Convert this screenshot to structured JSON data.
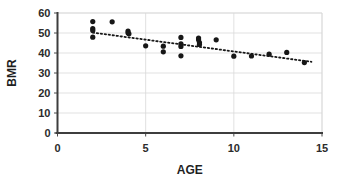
{
  "chart_data": {
    "type": "scatter",
    "title": "",
    "xlabel": "AGE",
    "ylabel": "BMR",
    "xlim": [
      0,
      15
    ],
    "ylim": [
      0,
      60
    ],
    "xticks": [
      0,
      5,
      10,
      15
    ],
    "yticks": [
      0,
      10,
      20,
      30,
      40,
      50,
      60
    ],
    "grid": "horizontal-and-vertical",
    "legend": "none",
    "marker": "filled-circle",
    "marker_color": "#171717",
    "points": [
      {
        "x": 2.0,
        "y": 55.7
      },
      {
        "x": 2.0,
        "y": 52.2
      },
      {
        "x": 2.0,
        "y": 51.3
      },
      {
        "x": 2.0,
        "y": 47.9
      },
      {
        "x": 3.1,
        "y": 55.6
      },
      {
        "x": 4.0,
        "y": 51.0
      },
      {
        "x": 4.0,
        "y": 50.1
      },
      {
        "x": 4.05,
        "y": 49.6
      },
      {
        "x": 5.0,
        "y": 43.6
      },
      {
        "x": 6.0,
        "y": 43.4
      },
      {
        "x": 6.0,
        "y": 40.6
      },
      {
        "x": 7.0,
        "y": 47.8
      },
      {
        "x": 7.0,
        "y": 44.6
      },
      {
        "x": 7.0,
        "y": 43.3
      },
      {
        "x": 7.0,
        "y": 38.6
      },
      {
        "x": 8.0,
        "y": 47.5
      },
      {
        "x": 8.0,
        "y": 46.6
      },
      {
        "x": 8.05,
        "y": 45.2
      },
      {
        "x": 8.05,
        "y": 44.3
      },
      {
        "x": 9.0,
        "y": 46.6
      },
      {
        "x": 10.0,
        "y": 38.4
      },
      {
        "x": 11.0,
        "y": 38.5
      },
      {
        "x": 12.0,
        "y": 39.4
      },
      {
        "x": 13.0,
        "y": 40.3
      },
      {
        "x": 14.0,
        "y": 35.2
      }
    ],
    "trendline": {
      "style": "dotted",
      "x_start": 2.0,
      "y_start": 50.2,
      "x_end": 14.4,
      "y_end": 35.6
    }
  },
  "axes": {
    "y_tick_labels": [
      "0",
      "10",
      "20",
      "30",
      "40",
      "50",
      "60"
    ],
    "x_tick_labels": [
      "0",
      "5",
      "10",
      "15"
    ],
    "y_title": "BMR",
    "x_title": "AGE"
  }
}
